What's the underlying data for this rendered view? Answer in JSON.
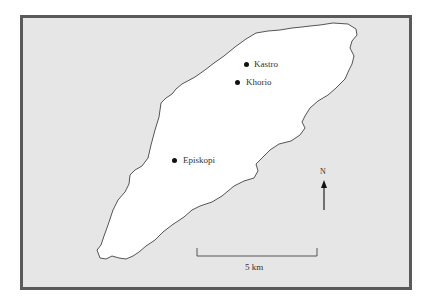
{
  "map": {
    "places": [
      {
        "name": "Kastro",
        "x": 246,
        "y": 64
      },
      {
        "name": "Khorio",
        "x": 237,
        "y": 82
      },
      {
        "name": "Episkopi",
        "x": 174,
        "y": 160
      }
    ],
    "north_label": "N",
    "scale_label": "5 km",
    "colors": {
      "sea": "#e6e6e6",
      "land": "#ffffff",
      "frame": "#5a5a5a",
      "coastline": "#555555"
    }
  }
}
